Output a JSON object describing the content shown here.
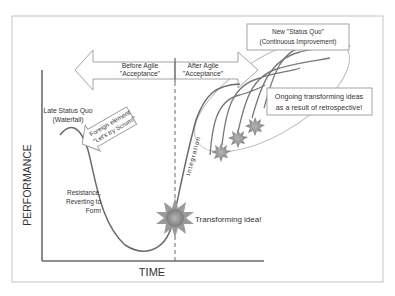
{
  "axes": {
    "y_label": "PERFORMANCE",
    "x_label": "TIME"
  },
  "phase_arrows": {
    "before": {
      "line1": "Before Agile",
      "line2": "\"Acceptance\""
    },
    "after": {
      "line1": "After Agile",
      "line2": "\"Acceptance\""
    }
  },
  "labels": {
    "late_status_quo_1": "Late Status Quo",
    "late_status_quo_2": "(Waterfall)",
    "foreign_element_1": "Foreign element:",
    "foreign_element_2": "\"Let's try Scrum!\"",
    "resistance_1": "Resistance,",
    "resistance_2": "Reverting to",
    "resistance_3": "Form",
    "transforming_idea": "Transforming idea!",
    "integration": "Integration",
    "new_status_quo_1": "New \"Status Quo\"",
    "new_status_quo_2": "(Continuous Improvement)",
    "ongoing_1": "Ongoing transforming ideas",
    "ongoing_2": "as a result of retrospective!"
  },
  "colors": {
    "line": "#6b6b6b",
    "frame": "#bdbdbd",
    "star": "#8a8a8a",
    "text": "#333333"
  }
}
